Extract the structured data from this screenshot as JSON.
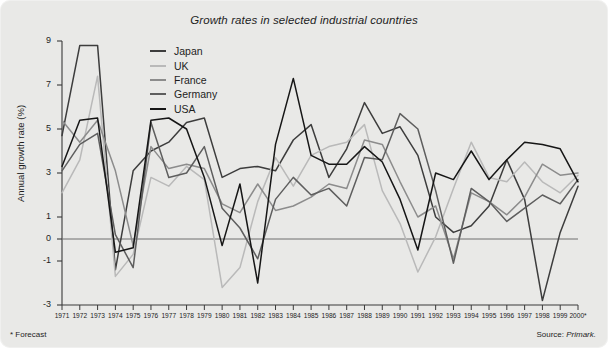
{
  "figure": {
    "background_color": "#e9e9e7",
    "footnote": "* Forecast",
    "source_prefix": "Source: ",
    "source_name": "Primark."
  },
  "axis": {
    "ylabel": "Annual growth rate (%)",
    "yticks": [
      9,
      7,
      5,
      3,
      1,
      0,
      -1,
      -3
    ],
    "ytick_labels": [
      "9",
      "7",
      "5",
      "3",
      "1",
      "0",
      "-1",
      "-3"
    ],
    "ylim": [
      -3,
      9
    ],
    "xlim": [
      1971,
      2000
    ],
    "zero_line_color": "#6f6f6f",
    "axis_color": "#3a3a3a"
  },
  "legend": {
    "position": "inside-top-left",
    "entries": [
      {
        "label": "Japan",
        "color": "#3d3d3d"
      },
      {
        "label": "UK",
        "color": "#b9b9b9"
      },
      {
        "label": "France",
        "color": "#8c8c8c"
      },
      {
        "label": "Germany",
        "color": "#5e5e5e"
      },
      {
        "label": "USA",
        "color": "#161616"
      }
    ]
  },
  "chart_data": {
    "type": "line",
    "title": "Growth rates in selected industrial countries",
    "xlabel": "",
    "ylabel": "Annual growth rate (%)",
    "ylim": [
      -3,
      9
    ],
    "grid": false,
    "legend_position": "inside-top-left",
    "annotations": [
      "* Forecast",
      "Source: Primark."
    ],
    "x": [
      1971,
      1972,
      1973,
      1974,
      1975,
      1976,
      1977,
      1978,
      1979,
      1980,
      1981,
      1982,
      1983,
      1984,
      1985,
      1986,
      1987,
      1988,
      1989,
      1990,
      1991,
      1992,
      1993,
      1994,
      1995,
      1996,
      1997,
      1998,
      1999,
      2000
    ],
    "xtick_labels": [
      "1971",
      "1972",
      "1973",
      "1974",
      "1975",
      "1976",
      "1977",
      "1978",
      "1979",
      "1980",
      "1981",
      "1982",
      "1983",
      "1984",
      "1985",
      "1986",
      "1987",
      "1988",
      "1989",
      "1990",
      "1991",
      "1992",
      "1993",
      "1994",
      "1995",
      "1996",
      "1997",
      "1998",
      "1999",
      "2000*"
    ],
    "series": [
      {
        "name": "Japan",
        "color": "#3d3d3d",
        "values": [
          4.7,
          8.8,
          8.8,
          -1.4,
          3.1,
          4.0,
          4.4,
          5.3,
          5.5,
          2.8,
          3.2,
          3.3,
          3.1,
          4.5,
          5.2,
          2.8,
          4.1,
          6.2,
          4.8,
          5.1,
          3.8,
          1.0,
          0.3,
          0.6,
          1.5,
          3.6,
          1.8,
          -2.8,
          0.3,
          2.4
        ]
      },
      {
        "name": "UK",
        "color": "#b9b9b9",
        "values": [
          2.1,
          3.6,
          7.4,
          -1.7,
          -0.7,
          2.8,
          2.4,
          3.3,
          2.7,
          -2.2,
          -1.3,
          1.7,
          3.7,
          2.4,
          3.8,
          4.2,
          4.4,
          5.2,
          2.2,
          0.7,
          -1.5,
          0.1,
          2.3,
          4.4,
          2.8,
          2.6,
          3.5,
          2.6,
          2.1,
          2.9
        ]
      },
      {
        "name": "France",
        "color": "#8c8c8c",
        "values": [
          5.4,
          4.4,
          5.4,
          3.1,
          -0.3,
          4.2,
          3.2,
          3.4,
          3.2,
          1.6,
          1.2,
          2.5,
          1.3,
          1.5,
          1.9,
          2.5,
          2.3,
          4.5,
          4.3,
          2.6,
          1.0,
          1.5,
          -0.9,
          2.1,
          1.7,
          1.1,
          1.9,
          3.4,
          2.9,
          3.0
        ]
      },
      {
        "name": "Germany",
        "color": "#5e5e5e",
        "values": [
          3.1,
          4.3,
          4.8,
          0.2,
          -1.3,
          5.3,
          2.8,
          3.0,
          4.2,
          1.4,
          0.5,
          -0.9,
          1.8,
          2.8,
          2.0,
          2.3,
          1.5,
          3.7,
          3.6,
          5.7,
          5.0,
          2.2,
          -1.1,
          2.3,
          1.7,
          0.8,
          1.4,
          2.0,
          1.6,
          2.7
        ]
      },
      {
        "name": "USA",
        "color": "#161616",
        "values": [
          3.3,
          5.4,
          5.5,
          -0.6,
          -0.4,
          5.4,
          5.5,
          5.0,
          2.8,
          -0.3,
          2.5,
          -2.0,
          4.3,
          7.3,
          3.8,
          3.4,
          3.4,
          4.2,
          3.5,
          1.8,
          -0.5,
          3.0,
          2.7,
          4.0,
          2.7,
          3.6,
          4.4,
          4.3,
          4.1,
          2.6
        ]
      }
    ]
  }
}
